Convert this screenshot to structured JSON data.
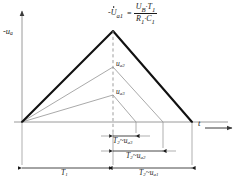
{
  "figure": {
    "background": "#ffffff",
    "ink": "#1a1a1a",
    "thin_ink": "#8c8c8c",
    "axis_ink": "#9a9a9a"
  },
  "axes": {
    "y_label_prefix": "-",
    "y_label_symbol": "u",
    "y_label_sub": "a",
    "x_label_symbol": "t",
    "y_axis_arrow": "up",
    "x_axis_arrow": "right"
  },
  "formula": {
    "lhs_sign": "-",
    "lhs_symbol": "U",
    "lhs_sub": "a1",
    "equals": "=",
    "numerator_a": "U",
    "numerator_a_sub": "B",
    "numerator_dot": "·",
    "numerator_b": "T",
    "numerator_b_sub": "1",
    "denominator_a": "R",
    "denominator_a_sub": "1",
    "denominator_dot": "·",
    "denominator_b": "C",
    "denominator_b_sub": "1",
    "plain_text": "-Ù1 = (UB · T₁) / (R₁ · C₁)"
  },
  "curves": [
    {
      "name": "waveform-primary",
      "peak_label_symbol": "U",
      "peak_label_sub": "a1",
      "peak_label_visible": false,
      "stroke": "#111111",
      "stroke_width": 2.1,
      "peak_height_px": 91,
      "fall_end_x_px": 192
    },
    {
      "name": "waveform-secondary",
      "peak_label_symbol": "u",
      "peak_label_sub": "a2",
      "peak_label_visible": true,
      "stroke": "#9a9a9a",
      "stroke_width": 0.8,
      "peak_height_px": 55,
      "fall_end_x_px": 163
    },
    {
      "name": "waveform-tertiary",
      "peak_label_symbol": "u",
      "peak_label_sub": "a3",
      "peak_label_visible": true,
      "stroke": "#9a9a9a",
      "stroke_width": 0.8,
      "peak_height_px": 27,
      "fall_end_x_px": 136
    }
  ],
  "peak_labels": [
    {
      "symbol": "u",
      "sub": "a2"
    },
    {
      "symbol": "u",
      "sub": "a3"
    }
  ],
  "dimensions": [
    {
      "name": "dim-t2-ua3",
      "symbol_a": "T",
      "sub_a": "2",
      "tilde": "~",
      "symbol_b": "u",
      "sub_b": "a3",
      "plain_text": "T₂~uₐ₃"
    },
    {
      "name": "dim-t2-ua2",
      "symbol_a": "T",
      "sub_a": "2",
      "tilde": "~",
      "symbol_b": "u",
      "sub_b": "a2",
      "plain_text": "T₂~uₐ₂"
    },
    {
      "name": "dim-t2-ua1",
      "symbol_a": "T",
      "sub_a": "2",
      "tilde": "~",
      "symbol_b": "u",
      "sub_b": "a1",
      "plain_text": "T₂~uₐ₁"
    },
    {
      "name": "dim-t1",
      "symbol_a": "T",
      "sub_a": "1",
      "tilde": "",
      "symbol_b": "",
      "sub_b": "",
      "plain_text": "T₁"
    }
  ],
  "geometry": {
    "origin_x": 22,
    "baseline_y": 122,
    "peak_x": 113,
    "y_axis_top": 8,
    "x_axis_right": 232
  }
}
